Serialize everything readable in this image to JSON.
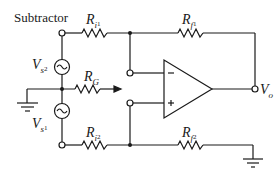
{
  "diagram": {
    "title": "Subtractor",
    "type": "op-amp differential amplifier (subtractor) circuit",
    "labels": {
      "Ri1": {
        "main": "R",
        "sub": "i",
        "subsub": "1"
      },
      "Rf1": {
        "main": "R",
        "sub": "f",
        "subsub": "1"
      },
      "Vs2": {
        "main": "V",
        "sub": "s",
        "subsub": "2"
      },
      "RG": {
        "main": "R",
        "sub": "G"
      },
      "Vs1": {
        "main": "V",
        "sub": "s",
        "subsub": "1"
      },
      "Ri2": {
        "main": "R",
        "sub": "i",
        "subsub": "2"
      },
      "Rf2": {
        "main": "R",
        "sub": "f",
        "subsub": "2"
      },
      "Vo": {
        "main": "V",
        "sub": "o"
      }
    },
    "opamp": {
      "inverting": "−",
      "noninverting": "+"
    },
    "colors": {
      "line": "#1a1a1a",
      "background": "#ffffff"
    }
  }
}
